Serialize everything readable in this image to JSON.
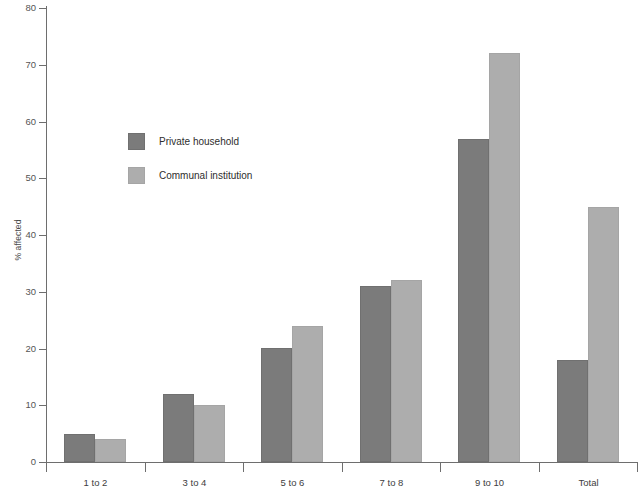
{
  "chart_data": {
    "type": "bar",
    "title": "",
    "subtitle": "",
    "xlabel": "",
    "ylabel": "% affected",
    "categories": [
      "1 to 2",
      "3 to 4",
      "5 to 6",
      "7 to 8",
      "9 to 10",
      "Total"
    ],
    "series": [
      {
        "name": "Private household",
        "color": "#7b7b7b",
        "values": [
          5,
          12,
          20,
          31,
          57,
          18
        ]
      },
      {
        "name": "Communal institution",
        "color": "#adadad",
        "values": [
          4,
          10,
          24,
          32,
          72,
          45
        ]
      }
    ],
    "ylim": [
      0,
      80
    ],
    "ytick_values": [
      0,
      10,
      20,
      30,
      40,
      50,
      60,
      70,
      80
    ],
    "ytick_labels": [
      "0",
      "10",
      "20",
      "30",
      "40",
      "50",
      "60",
      "70",
      "80"
    ],
    "grid": false,
    "legend_position": "inside upper-left",
    "annotations": []
  },
  "legend": {
    "items": [
      {
        "label": "Private household",
        "swatch": "dark"
      },
      {
        "label": "Communal institution",
        "swatch": "light"
      }
    ]
  },
  "colors": {
    "series_private_household": "#7b7b7b",
    "series_communal_institution": "#adadad",
    "axis": "#6e6e6e",
    "tick_text": "#555555",
    "background": "#ffffff"
  }
}
